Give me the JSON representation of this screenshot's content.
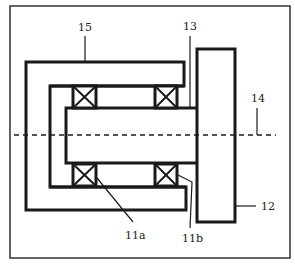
{
  "diagram": {
    "type": "mechanical cross-section",
    "colors": {
      "stroke": "#1a1a1a",
      "background": "#ffffff",
      "frame": "#333333"
    },
    "labels": {
      "housing": "15",
      "seal_gap": "13",
      "axis": "14",
      "plate": "12",
      "bearing_a": "11a",
      "bearing_b": "11b"
    },
    "components": [
      {
        "id": "15",
        "name": "housing"
      },
      {
        "id": "13",
        "name": "gap / seal"
      },
      {
        "id": "14",
        "name": "rotation axis (dashed)"
      },
      {
        "id": "12",
        "name": "plate / rotor"
      },
      {
        "id": "11a",
        "name": "bearing a"
      },
      {
        "id": "11b",
        "name": "bearing b"
      }
    ]
  }
}
